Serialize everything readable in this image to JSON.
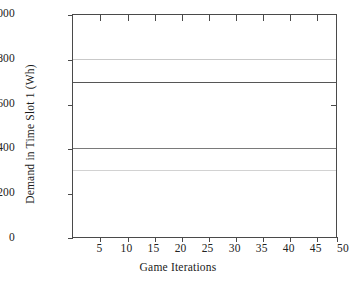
{
  "chart_data": {
    "type": "line",
    "title": "",
    "xlabel": "Game Iterations",
    "ylabel": "Demand in Time Slot 1 (Wh)",
    "xlim": [
      1,
      50
    ],
    "ylim": [
      0,
      1000
    ],
    "xticks": [
      5,
      10,
      15,
      20,
      25,
      30,
      35,
      40,
      45,
      50
    ],
    "yticks": [
      0,
      200,
      400,
      600,
      800,
      1000
    ],
    "grid": false,
    "legend": "none",
    "x": [
      1,
      50
    ],
    "series": [
      {
        "name": "Line A",
        "value": 800,
        "values": [
          800,
          800
        ],
        "color": "#c9c9c9",
        "width": 1.3
      },
      {
        "name": "Line B",
        "value": 700,
        "values": [
          700,
          700
        ],
        "color": "#565656",
        "width": 1.8
      },
      {
        "name": "Line C",
        "value": 400,
        "values": [
          400,
          400
        ],
        "color": "#7a7a7a",
        "width": 1.6
      },
      {
        "name": "Line D",
        "value": 300,
        "values": [
          300,
          300
        ],
        "color": "#d2d2d2",
        "width": 1.2
      }
    ]
  },
  "axes": {
    "y_tick_labels": [
      "1000",
      "800",
      "600",
      "400",
      "200",
      "0"
    ],
    "x_tick_labels": [
      "5",
      "10",
      "15",
      "20",
      "25",
      "30",
      "35",
      "40",
      "45",
      "50"
    ],
    "x_title": "Game Iterations",
    "y_title": "Demand in Time Slot 1 (Wh)"
  },
  "colors": {
    "axis": "#4a4a4a",
    "background": "#ffffff",
    "text": "#1a1a1a"
  }
}
